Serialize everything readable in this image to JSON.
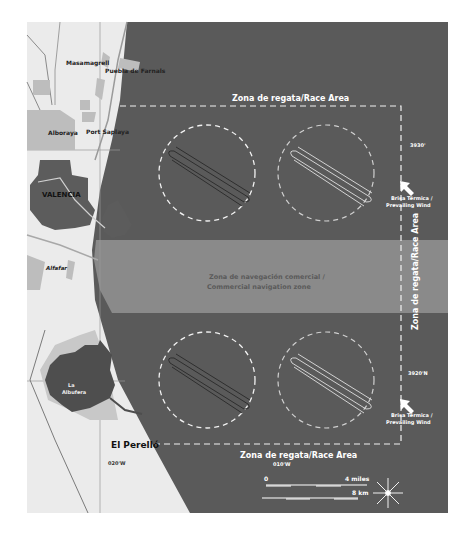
{
  "colors": {
    "sea": "#5a5a5a",
    "land": "#ebebeb",
    "urban_light": "#bdbdbd",
    "urban_dark": "#5c5c5c",
    "lake": "#4e4e4e",
    "nav_band": "#8a8a8a",
    "white_line": "#f2f2f2"
  },
  "places": {
    "masamagrell": "Masamagrell",
    "puebla_de_farnals": "Puebla de Farnals",
    "alboraya": "Alboraya",
    "port_saplaya": "Port Saplaya",
    "valencia": "VALENCIA",
    "alfafar": "Alfafar",
    "la_albufera_line1": "La",
    "la_albufera_line2": "Albufera",
    "el_perello": "El Perelló"
  },
  "race_area": {
    "top_label": "Zona de regata/Race Area",
    "bottom_label": "Zona de regata/Race Area",
    "side_label": "Zona de regata/Race Area"
  },
  "navigation_zone": {
    "line1": "Zona de navegación comercial /",
    "line2": "Commercial navigation zone"
  },
  "wind": {
    "upper_line1": "Brisa Térmica /",
    "upper_line2": "Prevailing Wind",
    "lower_line1": "Brisa Térmica /",
    "lower_line2": "Prevailing Wind"
  },
  "coordinates": {
    "lat_upper": "3930'",
    "lat_lower": "3920'N",
    "lon_left": "020'W",
    "lon_center": "010'W"
  },
  "scale": {
    "zero": "0",
    "miles": "4 miles",
    "km": "8 km"
  }
}
